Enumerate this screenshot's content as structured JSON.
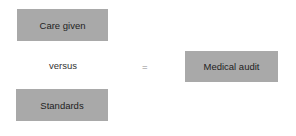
{
  "diagram": {
    "boxes": {
      "care_given": "Care given",
      "standards": "Standards",
      "medical_audit": "Medical audit"
    },
    "connector": "versus",
    "operator": "=",
    "box_color": "#a9a9a9"
  }
}
